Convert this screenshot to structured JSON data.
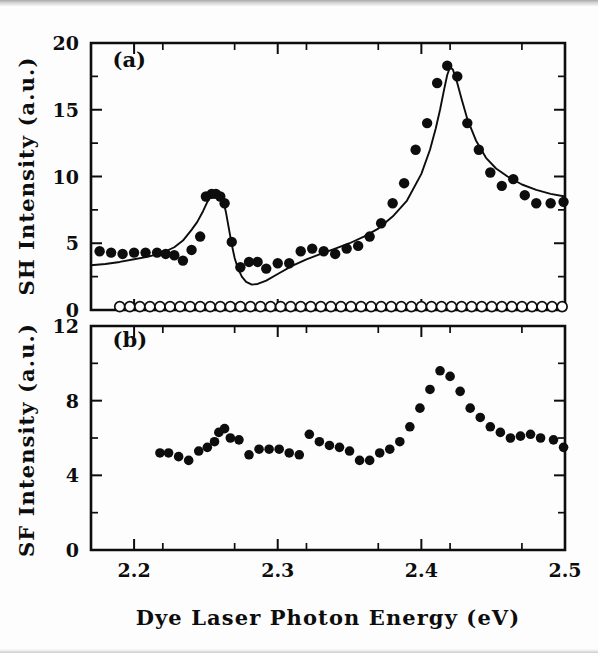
{
  "figure": {
    "background_color": "#fdfdfd",
    "ink_color": "#0d0d0d",
    "xaxis_title": "Dye Laser Photon Energy (eV)",
    "panel_a_label": "(a)",
    "panel_b_label": "(b)",
    "panel_a_ylabel": "SH Intensity (a.u.)",
    "panel_b_ylabel": "SF Intensity (a.u.)"
  },
  "chart_data": [
    {
      "type": "scatter",
      "panel": "(a)",
      "title": "SH Intensity vs Dye Laser Photon Energy",
      "xlabel": "Dye Laser Photon Energy (eV)",
      "ylabel": "SH Intensity (a.u.)",
      "xlim": [
        2.17,
        2.5
      ],
      "ylim": [
        0,
        20
      ],
      "xticks": [
        2.2,
        2.3,
        2.4,
        2.5
      ],
      "xticklabels": [
        "2.2",
        "2.3",
        "2.4",
        "2.5"
      ],
      "yticks": [
        0,
        5,
        10,
        15,
        20
      ],
      "yticklabels": [
        "0",
        "5",
        "10",
        "15",
        "20"
      ],
      "y_minor_tick_step": 2.5,
      "x_minor_tick_step": 0.05,
      "grid": false,
      "legend": false,
      "series": [
        {
          "name": "SH signal (filled circles)",
          "marker": "filled-circle",
          "x": [
            2.176,
            2.184,
            2.192,
            2.2,
            2.208,
            2.216,
            2.222,
            2.228,
            2.234,
            2.24,
            2.246,
            2.25,
            2.254,
            2.257,
            2.26,
            2.263,
            2.268,
            2.274,
            2.28,
            2.286,
            2.292,
            2.3,
            2.308,
            2.316,
            2.324,
            2.332,
            2.34,
            2.348,
            2.356,
            2.364,
            2.372,
            2.38,
            2.388,
            2.396,
            2.404,
            2.411,
            2.418,
            2.425,
            2.432,
            2.44,
            2.448,
            2.456,
            2.464,
            2.472,
            2.48,
            2.49,
            2.499
          ],
          "y": [
            4.4,
            4.3,
            4.2,
            4.3,
            4.3,
            4.3,
            4.2,
            4.1,
            3.7,
            4.5,
            5.5,
            8.5,
            8.7,
            8.7,
            8.5,
            8.0,
            5.1,
            3.2,
            3.6,
            3.6,
            3.1,
            3.5,
            3.5,
            4.4,
            4.6,
            4.4,
            4.2,
            4.6,
            4.8,
            5.5,
            6.5,
            8.0,
            9.5,
            12.0,
            14.0,
            17.0,
            18.3,
            17.5,
            14.0,
            12.0,
            10.3,
            9.3,
            9.8,
            8.6,
            8.0,
            8.0,
            8.1
          ]
        },
        {
          "name": "Background / reference (open circles)",
          "marker": "open-circle",
          "x": [
            2.19,
            2.197,
            2.204,
            2.211,
            2.218,
            2.225,
            2.232,
            2.239,
            2.246,
            2.253,
            2.26,
            2.267,
            2.274,
            2.281,
            2.288,
            2.295,
            2.302,
            2.309,
            2.316,
            2.323,
            2.33,
            2.337,
            2.344,
            2.351,
            2.358,
            2.365,
            2.372,
            2.379,
            2.386,
            2.393,
            2.4,
            2.407,
            2.414,
            2.421,
            2.428,
            2.435,
            2.442,
            2.449,
            2.456,
            2.463,
            2.47,
            2.477,
            2.484,
            2.491,
            2.498
          ],
          "y": [
            0.25,
            0.25,
            0.25,
            0.25,
            0.25,
            0.25,
            0.25,
            0.25,
            0.25,
            0.25,
            0.25,
            0.25,
            0.25,
            0.25,
            0.25,
            0.25,
            0.25,
            0.25,
            0.25,
            0.25,
            0.25,
            0.25,
            0.25,
            0.25,
            0.25,
            0.25,
            0.25,
            0.25,
            0.25,
            0.25,
            0.25,
            0.25,
            0.25,
            0.25,
            0.25,
            0.25,
            0.25,
            0.25,
            0.25,
            0.25,
            0.25,
            0.25,
            0.25,
            0.25,
            0.25
          ]
        },
        {
          "name": "Two-resonance fit (solid curve)",
          "marker": "line",
          "x": [
            2.17,
            2.18,
            2.19,
            2.2,
            2.21,
            2.22,
            2.228,
            2.234,
            2.24,
            2.244,
            2.248,
            2.251,
            2.254,
            2.256,
            2.258,
            2.26,
            2.262,
            2.264,
            2.266,
            2.268,
            2.27,
            2.272,
            2.275,
            2.278,
            2.282,
            2.286,
            2.292,
            2.3,
            2.31,
            2.32,
            2.33,
            2.34,
            2.35,
            2.36,
            2.37,
            2.38,
            2.39,
            2.4,
            2.406,
            2.41,
            2.413,
            2.416,
            2.418,
            2.42,
            2.422,
            2.425,
            2.428,
            2.432,
            2.438,
            2.445,
            2.452,
            2.46,
            2.47,
            2.48,
            2.49,
            2.5
          ],
          "y": [
            3.35,
            3.45,
            3.6,
            3.8,
            4.0,
            4.3,
            4.7,
            5.2,
            6.0,
            6.6,
            7.4,
            8.1,
            8.6,
            8.8,
            8.85,
            8.7,
            8.2,
            7.3,
            6.1,
            4.9,
            3.9,
            3.2,
            2.5,
            2.1,
            1.9,
            1.95,
            2.2,
            2.7,
            3.3,
            3.8,
            4.2,
            4.6,
            5.0,
            5.5,
            6.1,
            7.0,
            8.2,
            10.2,
            12.0,
            13.6,
            15.0,
            16.6,
            17.6,
            18.2,
            18.0,
            17.0,
            15.8,
            14.3,
            12.7,
            11.4,
            10.6,
            10.0,
            9.4,
            9.0,
            8.7,
            8.5
          ]
        }
      ],
      "annotations": [
        {
          "text": "(a)",
          "x": 2.185,
          "y": 18.2
        }
      ]
    },
    {
      "type": "scatter",
      "panel": "(b)",
      "title": "SF Intensity vs Dye Laser Photon Energy",
      "xlabel": "Dye Laser Photon Energy (eV)",
      "ylabel": "SF Intensity (a.u.)",
      "xlim": [
        2.17,
        2.5
      ],
      "ylim": [
        0,
        12
      ],
      "xticks": [
        2.2,
        2.3,
        2.4,
        2.5
      ],
      "xticklabels": [
        "2.2",
        "2.3",
        "2.4",
        "2.5"
      ],
      "yticks": [
        0,
        4,
        8,
        12
      ],
      "yticklabels": [
        "0",
        "4",
        "8",
        "12"
      ],
      "y_minor_tick_step": 2,
      "x_minor_tick_step": 0.05,
      "grid": false,
      "legend": false,
      "series": [
        {
          "name": "SF signal (filled circles)",
          "marker": "filled-circle",
          "x": [
            2.218,
            2.224,
            2.231,
            2.238,
            2.245,
            2.251,
            2.256,
            2.259,
            2.263,
            2.267,
            2.273,
            2.28,
            2.287,
            2.294,
            2.301,
            2.308,
            2.315,
            2.322,
            2.329,
            2.336,
            2.343,
            2.35,
            2.357,
            2.364,
            2.371,
            2.378,
            2.385,
            2.392,
            2.399,
            2.406,
            2.413,
            2.42,
            2.427,
            2.434,
            2.441,
            2.448,
            2.455,
            2.462,
            2.469,
            2.476,
            2.483,
            2.492,
            2.499
          ],
          "y": [
            5.2,
            5.2,
            5.0,
            4.8,
            5.3,
            5.5,
            5.8,
            6.3,
            6.5,
            6.0,
            5.9,
            5.1,
            5.4,
            5.4,
            5.4,
            5.2,
            5.1,
            6.2,
            5.8,
            5.6,
            5.5,
            5.3,
            4.8,
            4.8,
            5.2,
            5.4,
            5.8,
            6.6,
            7.6,
            8.6,
            9.6,
            9.3,
            8.5,
            7.6,
            7.1,
            6.6,
            6.3,
            6.0,
            6.1,
            6.2,
            6.0,
            5.9,
            5.5
          ]
        }
      ],
      "annotations": [
        {
          "text": "(b)",
          "x": 2.185,
          "y": 10.9
        }
      ]
    }
  ]
}
